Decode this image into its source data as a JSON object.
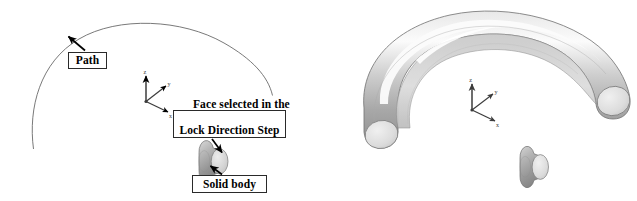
{
  "figure": {
    "background_color": "#ffffff",
    "width": 637,
    "height": 201
  },
  "colors": {
    "outline": "#555555",
    "path_curve": "#6a6a6a",
    "arrow": "#000000",
    "box_border": "#2a2a2a",
    "box_fill": "#ffffff",
    "text": "#000000",
    "triad": "#3c3c3c",
    "cylinder_body_dark": "#8f8f8f",
    "cylinder_body_mid": "#b3b3b3",
    "cylinder_face_light": "#d8d8d8",
    "tube_highlight": "#f2f2f2",
    "tube_mid": "#c4c4c4",
    "tube_shadow": "#9a9a9a",
    "tube_inner": "#d0d0d0"
  },
  "left_panel": {
    "name": "path-and-profile-view",
    "callouts": [
      {
        "id": "path",
        "label": "Path",
        "lines": [
          "Path"
        ],
        "points_to": "sweep-path-curve"
      },
      {
        "id": "face",
        "label": "Face selected in the Lock Direction Step",
        "lines": [
          "Face selected in the",
          "Lock Direction Step"
        ],
        "points_to": "profile-cylinder-end-face"
      },
      {
        "id": "solid",
        "label": "Solid body",
        "lines": [
          "Solid body"
        ],
        "points_to": "profile-cylinder-body"
      }
    ],
    "triad": {
      "axes": [
        "z",
        "y",
        "x"
      ],
      "z_label": "z",
      "y_label": "y",
      "x_label": "x"
    },
    "geometry": {
      "path_curve": "open circular arc",
      "solid_body": "short cylinder with highlighted circular end face"
    }
  },
  "right_panel": {
    "name": "swept-solid-result-view",
    "triad": {
      "axes": [
        "z",
        "y",
        "x"
      ],
      "z_label": "z",
      "y_label": "y",
      "x_label": "x"
    },
    "geometry": {
      "swept_tube": "C-shaped swept torus sector with flat circular end caps",
      "profile_cylinder": "detached short cylinder profile"
    }
  }
}
